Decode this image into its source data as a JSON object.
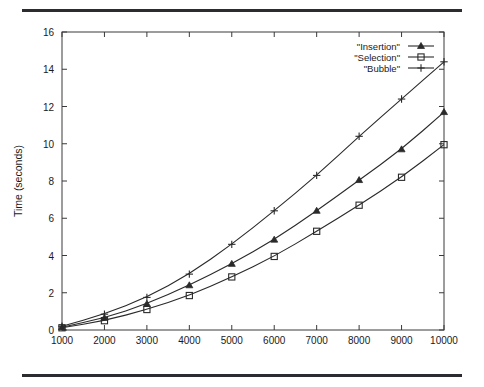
{
  "figure": {
    "top_rule": "horizontal-rule",
    "bottom_rule": "horizontal-rule"
  },
  "chart_data": {
    "type": "line",
    "title": "",
    "xlabel": "Number of elements",
    "ylabel": "Time (seconds)",
    "xlim": [
      1000,
      10000
    ],
    "ylim": [
      0,
      16
    ],
    "xticks": [
      1000,
      2000,
      3000,
      4000,
      5000,
      6000,
      7000,
      8000,
      9000,
      10000
    ],
    "yticks": [
      0,
      2,
      4,
      6,
      8,
      10,
      12,
      14,
      16
    ],
    "xtick_labels": [
      "1000",
      "2000",
      "3000",
      "4000",
      "5000",
      "6000",
      "7000",
      "8000",
      "9000",
      "10000"
    ],
    "ytick_labels": [
      "0",
      "2",
      "4",
      "6",
      "8",
      "10",
      "12",
      "14",
      "16"
    ],
    "grid": false,
    "legend_position": "top-right",
    "x": [
      1000,
      2000,
      3000,
      4000,
      5000,
      6000,
      7000,
      8000,
      9000,
      10000
    ],
    "series": [
      {
        "name": "\"Insertion\"",
        "marker": "triangle-filled",
        "values": [
          0.15,
          0.65,
          1.4,
          2.4,
          3.55,
          4.85,
          6.4,
          8.05,
          9.7,
          11.7
        ]
      },
      {
        "name": "\"Selection\"",
        "marker": "square",
        "values": [
          0.12,
          0.5,
          1.1,
          1.85,
          2.85,
          3.95,
          5.3,
          6.7,
          8.2,
          9.95
        ]
      },
      {
        "name": "\"Bubble\"",
        "marker": "plus",
        "values": [
          0.2,
          0.85,
          1.75,
          3.0,
          4.6,
          6.4,
          8.3,
          10.4,
          12.4,
          14.4
        ]
      }
    ]
  }
}
